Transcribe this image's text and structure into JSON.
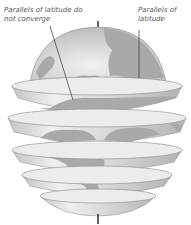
{
  "diagram": {
    "labels": {
      "left": "Parallels of latitude do not converge",
      "right": "Parallels of latitude"
    },
    "colors": {
      "disk_top": "#ececec",
      "band_light": "#e4e4e4",
      "band_shade": "#b8b8b8",
      "land": "#a9a9a9",
      "outline": "#8a8a8a",
      "axis": "#222222",
      "leader": "#333333",
      "text": "#555555"
    },
    "slices": [
      {
        "name": "north-cap"
      },
      {
        "name": "slice-1"
      },
      {
        "name": "slice-2"
      },
      {
        "name": "slice-3"
      },
      {
        "name": "slice-4"
      },
      {
        "name": "south-cap"
      }
    ]
  }
}
